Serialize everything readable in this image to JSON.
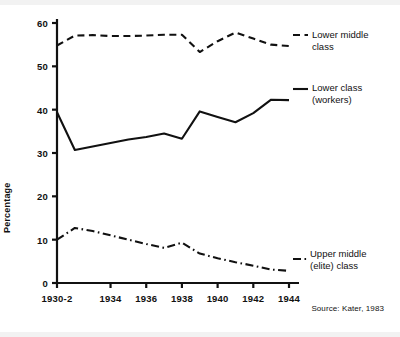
{
  "figure": {
    "y_axis_title": "Percentage",
    "source_note": "Source: Kater, 1983",
    "ink_color": "#111111",
    "background_color": "#ffffff"
  },
  "series_labels": {
    "lower_middle_line1": "Lower middle",
    "lower_middle_line2": "class",
    "lower_line1": "Lower class",
    "lower_line2": "(workers)",
    "upper_middle_line1": "Upper middle",
    "upper_middle_line2": "(elite) class"
  },
  "chart_data": {
    "type": "line",
    "title": "",
    "xlabel": "",
    "ylabel": "Percentage",
    "xlim": [
      1930,
      1945
    ],
    "ylim": [
      0,
      60
    ],
    "yticks": [
      0,
      10,
      20,
      30,
      40,
      50,
      60
    ],
    "ytick_labels": [
      "0",
      "10",
      "20",
      "30",
      "40",
      "50",
      "60"
    ],
    "xticks": [
      1931,
      1934,
      1936,
      1938,
      1940,
      1942,
      1944
    ],
    "xtick_labels": [
      "1930-2",
      "1934",
      "1936",
      "1938",
      "1940",
      "1942",
      "1944"
    ],
    "grid": false,
    "legend_position": "right-inline",
    "x": [
      1931,
      1932,
      1933,
      1934,
      1935,
      1936,
      1937,
      1938,
      1939,
      1940,
      1941,
      1942,
      1943,
      1944
    ],
    "series": [
      {
        "name": "Lower middle class",
        "linestyle": "dashed",
        "color": "#111111",
        "values": [
          54.8,
          57.1,
          57.2,
          57.0,
          57.0,
          57.1,
          57.3,
          57.3,
          53.3,
          55.8,
          57.8,
          56.4,
          55.0,
          54.7
        ]
      },
      {
        "name": "Lower class (workers)",
        "linestyle": "solid",
        "color": "#111111",
        "values": [
          39.4,
          30.7,
          31.5,
          32.3,
          33.1,
          33.7,
          34.5,
          33.3,
          39.6,
          38.3,
          37.1,
          39.2,
          42.3,
          42.2
        ]
      },
      {
        "name": "Upper middle (elite) class",
        "linestyle": "dashdot",
        "color": "#111111",
        "values": [
          10.0,
          12.7,
          12.0,
          11.0,
          10.0,
          9.0,
          8.1,
          9.3,
          6.8,
          5.7,
          4.8,
          4.0,
          3.1,
          2.8
        ]
      }
    ]
  }
}
